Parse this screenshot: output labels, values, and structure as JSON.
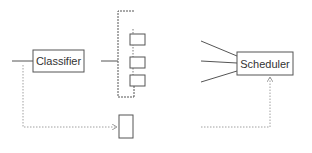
{
  "diagram": {
    "colors": {
      "background": "#ffffff",
      "stroke": "#555555",
      "dotted": "#888888",
      "text": "#333333"
    },
    "nodes": {
      "classifier": {
        "label": "Classifier"
      },
      "scheduler": {
        "label": "Scheduler"
      }
    },
    "queue": {
      "slots": 3
    },
    "scheduler_inputs": 3
  }
}
